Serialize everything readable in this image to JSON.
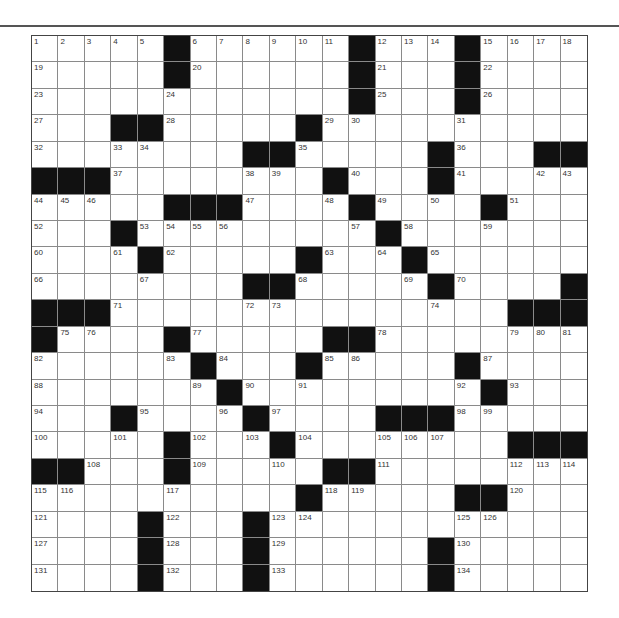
{
  "puzzle": {
    "size": {
      "rows": 21,
      "cols": 21
    },
    "rows": [
      ".....#......#...#....",
      ".....#......#...#....",
      "............#...#....",
      "...##.....#..........",
      "........##.....#...##",
      "###........#...#.....",
      ".....###....#....#...",
      "...#.........#.......",
      "....#.....#...#......",
      "........##.....#....#",
      "###...............###",
      "#....#.....##........",
      "......#...#.....#....",
      ".......#.........#...",
      "...#....#....###.....",
      ".....#...#........###",
      "##...#.....##........",
      "..........#.....##...",
      "....#...#............",
      "....#...#......#.....",
      "....#...#......#....."
    ],
    "numbers": [
      [
        [
          0,
          1
        ],
        [
          1,
          2
        ],
        [
          2,
          3
        ],
        [
          3,
          4
        ],
        [
          4,
          5
        ],
        [
          6,
          6
        ],
        [
          7,
          7
        ],
        [
          8,
          8
        ],
        [
          9,
          9
        ],
        [
          10,
          10
        ],
        [
          11,
          11
        ],
        [
          13,
          12
        ],
        [
          14,
          13
        ],
        [
          15,
          14
        ],
        [
          17,
          15
        ],
        [
          18,
          16
        ],
        [
          19,
          17
        ],
        [
          20,
          18
        ]
      ],
      [
        [
          0,
          19
        ],
        [
          6,
          20
        ],
        [
          13,
          21
        ],
        [
          17,
          22
        ]
      ],
      [
        [
          0,
          23
        ],
        [
          5,
          24
        ],
        [
          13,
          25
        ],
        [
          17,
          26
        ]
      ],
      [
        [
          0,
          27
        ],
        [
          5,
          28
        ],
        [
          11,
          29
        ],
        [
          12,
          30
        ],
        [
          16,
          31
        ]
      ],
      [
        [
          0,
          32
        ],
        [
          3,
          33
        ],
        [
          4,
          34
        ],
        [
          10,
          35
        ],
        [
          16,
          36
        ]
      ],
      [
        [
          3,
          37
        ],
        [
          8,
          38
        ],
        [
          9,
          39
        ],
        [
          12,
          40
        ],
        [
          16,
          41
        ],
        [
          19,
          42
        ],
        [
          20,
          43
        ]
      ],
      [
        [
          0,
          44
        ],
        [
          1,
          45
        ],
        [
          2,
          46
        ],
        [
          8,
          47
        ],
        [
          11,
          48
        ],
        [
          13,
          49
        ],
        [
          15,
          50
        ],
        [
          18,
          51
        ]
      ],
      [
        [
          0,
          52
        ],
        [
          4,
          53
        ],
        [
          5,
          54
        ],
        [
          6,
          55
        ],
        [
          7,
          56
        ],
        [
          12,
          57
        ],
        [
          14,
          58
        ],
        [
          17,
          59
        ]
      ],
      [
        [
          0,
          60
        ],
        [
          3,
          61
        ],
        [
          5,
          62
        ],
        [
          11,
          63
        ],
        [
          13,
          64
        ],
        [
          15,
          65
        ]
      ],
      [
        [
          0,
          66
        ],
        [
          4,
          67
        ],
        [
          10,
          68
        ],
        [
          14,
          69
        ],
        [
          16,
          70
        ]
      ],
      [
        [
          3,
          71
        ],
        [
          8,
          72
        ],
        [
          9,
          73
        ],
        [
          15,
          74
        ]
      ],
      [
        [
          1,
          75
        ],
        [
          2,
          76
        ],
        [
          6,
          77
        ],
        [
          13,
          78
        ],
        [
          18,
          79
        ],
        [
          19,
          80
        ],
        [
          20,
          81
        ]
      ],
      [
        [
          0,
          82
        ],
        [
          5,
          83
        ],
        [
          7,
          84
        ],
        [
          11,
          85
        ],
        [
          12,
          86
        ],
        [
          17,
          87
        ]
      ],
      [
        [
          0,
          88
        ],
        [
          6,
          89
        ],
        [
          8,
          90
        ],
        [
          10,
          91
        ],
        [
          16,
          92
        ],
        [
          18,
          93
        ]
      ],
      [
        [
          0,
          94
        ],
        [
          4,
          95
        ],
        [
          7,
          96
        ],
        [
          9,
          97
        ],
        [
          16,
          98
        ],
        [
          17,
          99
        ]
      ],
      [
        [
          0,
          100
        ],
        [
          3,
          101
        ],
        [
          6,
          102
        ],
        [
          8,
          103
        ],
        [
          10,
          104
        ],
        [
          13,
          105
        ],
        [
          14,
          106
        ],
        [
          15,
          107
        ]
      ],
      [
        [
          2,
          108
        ],
        [
          6,
          109
        ],
        [
          9,
          110
        ],
        [
          13,
          111
        ],
        [
          18,
          112
        ],
        [
          19,
          113
        ],
        [
          20,
          114
        ]
      ],
      [
        [
          0,
          115
        ],
        [
          1,
          116
        ],
        [
          5,
          117
        ],
        [
          11,
          118
        ],
        [
          12,
          119
        ],
        [
          18,
          120
        ]
      ],
      [
        [
          0,
          121
        ],
        [
          5,
          122
        ],
        [
          9,
          123
        ],
        [
          10,
          124
        ],
        [
          16,
          125
        ],
        [
          17,
          126
        ]
      ],
      [
        [
          0,
          127
        ],
        [
          5,
          128
        ],
        [
          9,
          129
        ],
        [
          16,
          130
        ]
      ],
      [
        [
          0,
          131
        ],
        [
          5,
          132
        ],
        [
          9,
          133
        ],
        [
          16,
          134
        ]
      ]
    ],
    "colors": {
      "block": "#111111",
      "cell": "#ffffff",
      "gridline": "#8a8a8a",
      "border": "#444444",
      "number": "#333333"
    }
  }
}
